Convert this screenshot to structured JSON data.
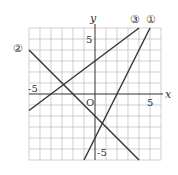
{
  "axes": {
    "x_label": "x",
    "y_label": "y",
    "origin": "O",
    "x_tick_neg": "-5",
    "x_tick_pos": "5",
    "y_tick_pos": "5",
    "y_tick_neg": "-5"
  },
  "lines": [
    {
      "label": "①",
      "equation": "y=2x-4"
    },
    {
      "label": "②",
      "equation": "y=-x-2"
    },
    {
      "label": "③",
      "equation": "y=3/4x+3"
    }
  ]
}
